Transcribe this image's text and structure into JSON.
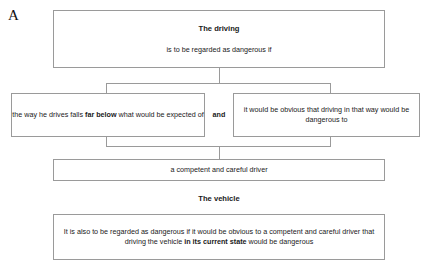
{
  "figure": {
    "label": "A"
  },
  "driving_block": {
    "heading": "The driving",
    "subtitle": "is to be regarded as dangerous if",
    "conjunction": "and",
    "condition_left": {
      "part1": "the way he drives falls ",
      "bold": "far below",
      "part2": " what would be expected of"
    },
    "condition_right": "it would be obvious that driving in that way would be dangerous to",
    "conclusion": "a competent and careful driver"
  },
  "vehicle_block": {
    "heading": "The vehicle",
    "part1": "It is also to be regarded as dangerous if it would be obvious to a competent and careful driver that driving the vehicle ",
    "bold": "in its current state",
    "part2": " would be dangerous"
  },
  "colors": {
    "border": "#9a9a9a",
    "text": "#1a1a1a",
    "background": "#ffffff"
  }
}
